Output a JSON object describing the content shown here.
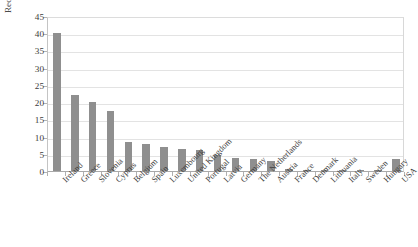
{
  "chart_data": {
    "type": "bar",
    "title": "",
    "subtitle": "",
    "xlabel": "",
    "ylabel": "Recapitalisation costs (% of GDP)",
    "ylim": [
      0,
      45
    ],
    "yticks": [
      0,
      5,
      10,
      15,
      20,
      25,
      30,
      35,
      40,
      45
    ],
    "ytick_labels": [
      "0",
      "5",
      "10",
      "15",
      "20",
      "25",
      "30",
      "35",
      "40",
      "45"
    ],
    "grid": true,
    "legend": null,
    "legend_position": "none",
    "bar_color": "#8f8f8f",
    "categories": [
      "Ireland",
      "Greece",
      "Slovenia",
      "Cyprus",
      "Belgium",
      "Spain",
      "Luxembourg",
      "United Kingdom",
      "Portugal",
      "Latvia",
      "Germany",
      "The Netherlands",
      "Austria",
      "France",
      "Denmark",
      "Lithuania",
      "Italy",
      "Sweden",
      "Hungary",
      "USA"
    ],
    "values": [
      40.0,
      22.1,
      20.0,
      17.5,
      8.5,
      7.8,
      7.1,
      6.5,
      6.0,
      4.6,
      3.9,
      3.5,
      3.0,
      0.6,
      0.4,
      0.3,
      0.25,
      0.15,
      0.1,
      3.4
    ],
    "annotations": []
  }
}
